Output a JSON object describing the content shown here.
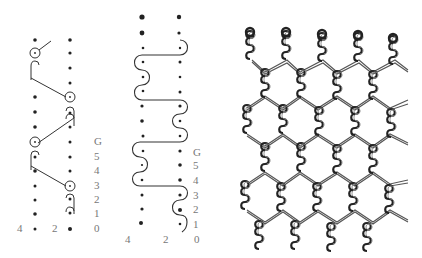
{
  "figure": {
    "panels": [
      {
        "id": "lapping-diagram-a",
        "type": "point-paper lapping diagram",
        "guide_bar_labels": [
          "G",
          "5",
          "4",
          "3",
          "2",
          "1",
          "0"
        ],
        "needle_labels": [
          "4",
          "2"
        ],
        "label_color": "#777777",
        "stroke_color": "#333333"
      },
      {
        "id": "lapping-diagram-b",
        "type": "point-paper lapping diagram",
        "guide_bar_labels": [
          "G",
          "5",
          "4",
          "3",
          "2",
          "1"
        ],
        "needle_labels": [
          "4",
          "2",
          "0"
        ],
        "label_color": "#777777",
        "stroke_color": "#333333"
      },
      {
        "id": "fabric-structure",
        "type": "hexagonal net (tulle) warp-knit fabric illustration",
        "wale_count": 5,
        "stroke_color": "#222222"
      }
    ]
  }
}
